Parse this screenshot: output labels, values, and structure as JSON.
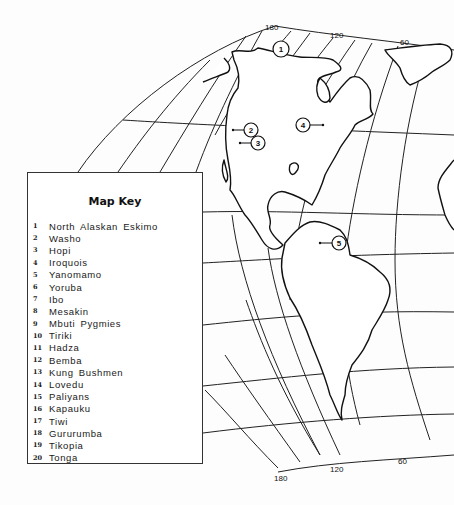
{
  "map": {
    "projection": "curved-graticule-americas",
    "longitude_labels_top": [
      "180",
      "120",
      "60"
    ],
    "longitude_labels_bottom": [
      "180",
      "120",
      "60"
    ],
    "markers": [
      {
        "id": "1",
        "label": "1",
        "x": 281,
        "y": 49
      },
      {
        "id": "2",
        "label": "2",
        "x": 251,
        "y": 130
      },
      {
        "id": "3",
        "label": "3",
        "x": 258,
        "y": 143
      },
      {
        "id": "4",
        "label": "4",
        "x": 303,
        "y": 125
      },
      {
        "id": "5",
        "label": "5",
        "x": 339,
        "y": 243
      }
    ]
  },
  "key": {
    "title": "Map Key",
    "items": [
      {
        "num": "1",
        "name": "North Alaskan Eskimo"
      },
      {
        "num": "2",
        "name": "Washo"
      },
      {
        "num": "3",
        "name": "Hopi"
      },
      {
        "num": "4",
        "name": "Iroquois"
      },
      {
        "num": "5",
        "name": "Yanomamo"
      },
      {
        "num": "6",
        "name": "Yoruba"
      },
      {
        "num": "7",
        "name": "Ibo"
      },
      {
        "num": "8",
        "name": "Mesakin"
      },
      {
        "num": "9",
        "name": "Mbuti Pygmies"
      },
      {
        "num": "10",
        "name": "Tiriki"
      },
      {
        "num": "11",
        "name": "Hadza"
      },
      {
        "num": "12",
        "name": "Bemba"
      },
      {
        "num": "13",
        "name": "Kung Bushmen"
      },
      {
        "num": "14",
        "name": "Lovedu"
      },
      {
        "num": "15",
        "name": "Paliyans"
      },
      {
        "num": "16",
        "name": "Kapauku"
      },
      {
        "num": "17",
        "name": "Tiwi"
      },
      {
        "num": "18",
        "name": "Gururumba"
      },
      {
        "num": "19",
        "name": "Tikopia"
      },
      {
        "num": "20",
        "name": "Tonga"
      }
    ]
  }
}
